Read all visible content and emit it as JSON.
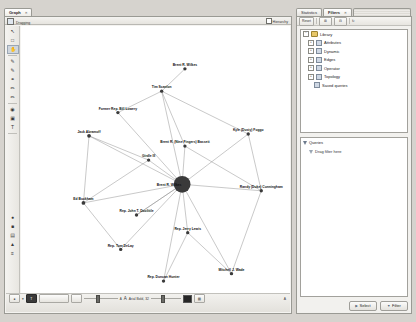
{
  "app": {
    "name": "Gephi"
  },
  "graph_window": {
    "tabs": [
      {
        "label": "Graph",
        "close": "×",
        "active": true
      }
    ],
    "toolbar": {
      "dragging_label": "Dragging",
      "dragging_icon": "hand-drag-icon",
      "hierarchy_label": "Hierarchy"
    },
    "left_tools": [
      {
        "name": "cursor-tool",
        "glyph": "↖",
        "active": false
      },
      {
        "name": "rectangle-select-tool",
        "glyph": "□",
        "active": false
      },
      {
        "name": "drag-tool",
        "glyph": "✋",
        "active": true
      },
      {
        "name": "brush-tool",
        "glyph": "✐",
        "active": false
      },
      {
        "name": "paint-tool",
        "glyph": "✐",
        "active": false
      },
      {
        "name": "shortest-path-tool",
        "glyph": "⚭",
        "active": false
      },
      {
        "name": "edge-pencil-tool",
        "glyph": "✒",
        "active": false
      },
      {
        "name": "node-pencil-tool",
        "glyph": "✒",
        "active": false
      },
      {
        "name": "heatmap-tool",
        "glyph": "◉",
        "active": false
      },
      {
        "name": "size-tool",
        "glyph": "▣",
        "active": false
      },
      {
        "name": "label-tool",
        "glyph": "T",
        "active": false
      }
    ],
    "bottom_tools": [
      {
        "name": "show-node-labels-button",
        "glyph": "●"
      },
      {
        "name": "show-edge-labels-button",
        "glyph": "■"
      },
      {
        "name": "label-color-button",
        "glyph": "▤"
      },
      {
        "name": "label-size-mode-button",
        "glyph": "▲"
      },
      {
        "name": "label-attributes-button",
        "glyph": "≡"
      }
    ],
    "bottom_bar": {
      "node_label_toggle": "●",
      "arrow_glyph": "▾",
      "font_button": "T",
      "font_value": "Arial Bold, 32",
      "size_small": "A",
      "size_large": "A",
      "edge_color_swatch": "#262626",
      "edge_weight_icon": "▤",
      "reset_icon": "A",
      "slider1_value": 35,
      "slider2_value": 55,
      "slider3_value": 30
    }
  },
  "right_dock": {
    "tabs": [
      {
        "label": "Statistics",
        "active": false
      },
      {
        "label": "Filters",
        "active": true,
        "close": "×"
      }
    ],
    "filters_toolbar": {
      "reset_label": "Reset",
      "buttons": [
        {
          "name": "new-filter-button",
          "glyph": "⊞"
        },
        {
          "name": "duplicate-filter-button",
          "glyph": "⊟"
        },
        {
          "name": "autorefresh-button",
          "glyph": "↻"
        }
      ]
    },
    "library": {
      "root": "Library",
      "items": [
        {
          "label": "Attributes",
          "expander": "+"
        },
        {
          "label": "Dynamic",
          "expander": "+"
        },
        {
          "label": "Edges",
          "expander": "+"
        },
        {
          "label": "Operator",
          "expander": "+"
        },
        {
          "label": "Topology",
          "expander": "+"
        },
        {
          "label": "Saved queries",
          "expander": ""
        }
      ]
    },
    "queries": {
      "title": "Queries",
      "placeholder": "Drag filter here"
    },
    "buttons": [
      {
        "label": "Select",
        "name": "select-button",
        "icon": "▶"
      },
      {
        "label": "Filter",
        "name": "filter-button",
        "icon": "▼"
      }
    ]
  },
  "chart_data": {
    "type": "network-graph",
    "layout": "force-directed",
    "nodes": [
      {
        "id": "abramoff",
        "label": "Jack Abramoff",
        "x": 72,
        "y": 118,
        "r": 2.0,
        "lx": 72,
        "ly": 115,
        "anchor": "middle"
      },
      {
        "id": "buckham",
        "label": "Ed Buckham",
        "x": 66,
        "y": 190,
        "r": 2.0,
        "lx": 66,
        "ly": 187,
        "anchor": "middle"
      },
      {
        "id": "lowery",
        "label": "Former Rep. Bill Lowery",
        "x": 103,
        "y": 93,
        "r": 1.8,
        "lx": 103,
        "ly": 90,
        "anchor": "middle"
      },
      {
        "id": "wilkes",
        "label": "Brent R. Wilkes",
        "x": 175,
        "y": 46,
        "r": 1.8,
        "lx": 175,
        "ly": 43,
        "anchor": "middle"
      },
      {
        "id": "scanlon",
        "label": "Tim Scanlon",
        "x": 150,
        "y": 70,
        "r": 1.8,
        "lx": 150,
        "ly": 67,
        "anchor": "middle"
      },
      {
        "id": "foggo",
        "label": "Kyle (Dusty) Foggo",
        "x": 243,
        "y": 116,
        "r": 1.8,
        "lx": 243,
        "ly": 113,
        "anchor": "middle"
      },
      {
        "id": "bassett",
        "label": "Brent R. (Nine Fingers) Bassett",
        "x": 175,
        "y": 129,
        "r": 1.8,
        "lx": 175,
        "ly": 126,
        "anchor": "middle"
      },
      {
        "id": "hub",
        "label": "Brent R. Wilkes",
        "x": 172,
        "y": 170,
        "r": 9.0,
        "lx": 158,
        "ly": 172,
        "anchor": "middle"
      },
      {
        "id": "cunningham",
        "label": "Randy (Duke) Cunningham",
        "x": 257,
        "y": 177,
        "r": 1.8,
        "lx": 257,
        "ly": 174,
        "anchor": "middle"
      },
      {
        "id": "doolittle",
        "label": "Rep. John T. Doolittle",
        "x": 123,
        "y": 203,
        "r": 1.8,
        "lx": 123,
        "ly": 200,
        "anchor": "middle"
      },
      {
        "id": "delay",
        "label": "Rep. Tom DeLay",
        "x": 106,
        "y": 240,
        "r": 1.8,
        "lx": 106,
        "ly": 237,
        "anchor": "middle"
      },
      {
        "id": "lewis",
        "label": "Rep. Jerry Lewis",
        "x": 178,
        "y": 222,
        "r": 1.8,
        "lx": 178,
        "ly": 219,
        "anchor": "middle"
      },
      {
        "id": "hunter",
        "label": "Rep. Duncan Hunter",
        "x": 152,
        "y": 274,
        "r": 1.8,
        "lx": 152,
        "ly": 271,
        "anchor": "middle"
      },
      {
        "id": "wade",
        "label": "Mitchell J. Wade",
        "x": 225,
        "y": 266,
        "r": 1.8,
        "lx": 225,
        "ly": 263,
        "anchor": "middle"
      },
      {
        "id": "other1",
        "label": "Girdle III",
        "x": 136,
        "y": 144,
        "r": 1.8,
        "lx": 136,
        "ly": 141,
        "anchor": "middle"
      }
    ],
    "edges": [
      {
        "source": "abramoff",
        "target": "buckham"
      },
      {
        "source": "abramoff",
        "target": "hub"
      },
      {
        "source": "lowery",
        "target": "hub"
      },
      {
        "source": "wilkes",
        "target": "scanlon"
      },
      {
        "source": "scanlon",
        "target": "hub"
      },
      {
        "source": "scanlon",
        "target": "foggo"
      },
      {
        "source": "scanlon",
        "target": "bassett"
      },
      {
        "source": "foggo",
        "target": "hub"
      },
      {
        "source": "bassett",
        "target": "hub"
      },
      {
        "source": "other1",
        "target": "hub"
      },
      {
        "source": "other1",
        "target": "buckham"
      },
      {
        "source": "buckham",
        "target": "delay"
      },
      {
        "source": "hub",
        "target": "cunningham"
      },
      {
        "source": "hub",
        "target": "doolittle"
      },
      {
        "source": "hub",
        "target": "delay"
      },
      {
        "source": "hub",
        "target": "lewis"
      },
      {
        "source": "hub",
        "target": "hunter"
      },
      {
        "source": "hub",
        "target": "wade"
      },
      {
        "source": "lewis",
        "target": "hunter"
      },
      {
        "source": "lewis",
        "target": "wade"
      },
      {
        "source": "doolittle",
        "target": "hub"
      },
      {
        "source": "foggo",
        "target": "cunningham"
      },
      {
        "source": "bassett",
        "target": "cunningham"
      },
      {
        "source": "abramoff",
        "target": "other1"
      },
      {
        "source": "lowery",
        "target": "scanlon"
      },
      {
        "source": "buckham",
        "target": "hub"
      },
      {
        "source": "wade",
        "target": "cunningham"
      }
    ],
    "node_color": "#3a3a3a",
    "edge_color": "#8a8a8a",
    "background": "#ffffff"
  }
}
